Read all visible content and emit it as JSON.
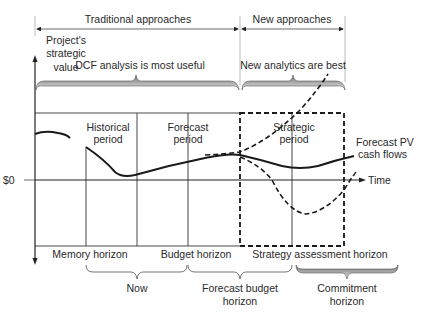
{
  "top_bands": {
    "traditional": "Traditional approaches",
    "new": "New approaches"
  },
  "y_axis": {
    "label_line1": "Project's",
    "label_line2": "strategic",
    "label_line3": "value",
    "zero_label": "$0"
  },
  "x_axis": {
    "label": "Time"
  },
  "top_braces": {
    "dcf": "DCF analysis is most useful",
    "new_analytics": "New analytics are best"
  },
  "periods": {
    "historical_line1": "Historical",
    "historical_line2": "period",
    "forecast_line1": "Forecast",
    "forecast_line2": "period",
    "strategic_line1": "Strategic",
    "strategic_line2": "period"
  },
  "curve_label": {
    "line1": "Forecast PV",
    "line2": "cash flows"
  },
  "horizons": {
    "memory": "Memory horizon",
    "budget": "Budget horizon",
    "strategy": "Strategy assessment horizon"
  },
  "bottom_braces": {
    "now": "Now",
    "forecast_budget_line1": "Forecast budget",
    "forecast_budget_line2": "horizon",
    "commitment_line1": "Commitment",
    "commitment_line2": "horizon"
  },
  "colors": {
    "ink": "#1a1a1a",
    "text": "#2a2a2a",
    "brace_shade_dark": "#6e6e6e",
    "brace_shade_light": "#e6e6e6"
  }
}
